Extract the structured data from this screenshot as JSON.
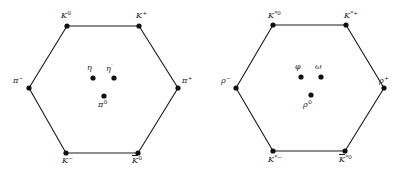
{
  "diagrams": [
    {
      "name": "pseudoscalar-meson-octet",
      "vertices": [
        {
          "id": "K0",
          "base": "K",
          "sup": "0",
          "bar": false,
          "x": 67,
          "y": 26,
          "lx": 61,
          "ly": 11
        },
        {
          "id": "Kplus",
          "base": "K",
          "sup": "+",
          "bar": false,
          "x": 139,
          "y": 26,
          "lx": 136,
          "ly": 11
        },
        {
          "id": "piplus",
          "base": "π",
          "sup": "+",
          "bar": false,
          "x": 178,
          "y": 88,
          "lx": 182,
          "ly": 76
        },
        {
          "id": "Kbar0",
          "base": "K",
          "sup": "0",
          "bar": true,
          "x": 138,
          "y": 153,
          "lx": 132,
          "ly": 156
        },
        {
          "id": "Kminus",
          "base": "K",
          "sup": "−",
          "bar": false,
          "x": 66,
          "y": 153,
          "lx": 62,
          "ly": 156
        },
        {
          "id": "piminus",
          "base": "π",
          "sup": "−",
          "bar": false,
          "x": 29,
          "y": 88,
          "lx": 13,
          "ly": 76
        }
      ],
      "center": [
        {
          "id": "eta",
          "base": "η",
          "sup": "",
          "x": 93,
          "y": 78,
          "lx": 87,
          "ly": 64
        },
        {
          "id": "etaprime",
          "base": "η",
          "sup": "′",
          "x": 114,
          "y": 78,
          "lx": 106,
          "ly": 64
        },
        {
          "id": "pi0",
          "base": "π",
          "sup": "0",
          "x": 104,
          "y": 96,
          "lx": 98,
          "ly": 100
        }
      ]
    },
    {
      "name": "vector-meson-octet",
      "vertices": [
        {
          "id": "Kstar0",
          "base": "K",
          "sup": "*0",
          "bar": false,
          "x": 273,
          "y": 25,
          "lx": 268,
          "ly": 11
        },
        {
          "id": "Kstarplus",
          "base": "K",
          "sup": "*+",
          "bar": false,
          "x": 346,
          "y": 25,
          "lx": 344,
          "ly": 11
        },
        {
          "id": "rhoplus",
          "base": "ρ",
          "sup": "+",
          "bar": false,
          "x": 384,
          "y": 88,
          "lx": 379,
          "ly": 76
        },
        {
          "id": "Kstarbar0",
          "base": "K",
          "sup": "*0",
          "bar": true,
          "x": 345,
          "y": 151,
          "lx": 339,
          "ly": 155
        },
        {
          "id": "Kstarminus",
          "base": "K",
          "sup": "*−",
          "bar": false,
          "x": 273,
          "y": 151,
          "lx": 268,
          "ly": 155
        },
        {
          "id": "rhominus",
          "base": "ρ",
          "sup": "−",
          "bar": false,
          "x": 236,
          "y": 88,
          "lx": 221,
          "ly": 76
        }
      ],
      "center": [
        {
          "id": "phi",
          "base": "φ",
          "sup": "",
          "x": 301,
          "y": 77,
          "lx": 295,
          "ly": 63
        },
        {
          "id": "omega",
          "base": "ω",
          "sup": "",
          "x": 321,
          "y": 77,
          "lx": 315,
          "ly": 63
        },
        {
          "id": "rho0",
          "base": "ρ",
          "sup": "0",
          "x": 311,
          "y": 95,
          "lx": 303,
          "ly": 100
        }
      ]
    }
  ],
  "style": {
    "line_color": "#1a1a1a",
    "dot_color": "#111111",
    "background": "#ffffff"
  }
}
